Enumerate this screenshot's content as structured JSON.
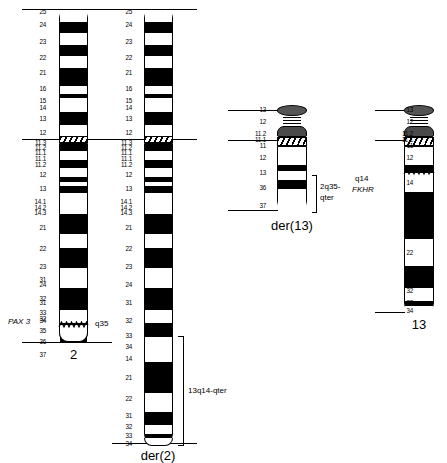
{
  "figure": {
    "type": "chromosome-ideogram"
  },
  "chromosomes": [
    {
      "id": "chr2",
      "name": "2",
      "type": "submetacentric",
      "p_labels": [
        "25",
        "24",
        "23",
        "22",
        "21",
        "16",
        "15",
        "14",
        "13",
        "12",
        "11.3",
        "11.2",
        "11.1"
      ],
      "q_labels": [
        "11.1",
        "11.2",
        "12",
        "13",
        "14.1",
        "14.2",
        "14.3",
        "21",
        "22",
        "23",
        "24",
        "31",
        "32",
        "33",
        "34",
        "35",
        "36",
        "37"
      ],
      "gene_label": "PAX 3",
      "breakpoint_label": "q35",
      "breakpoint_band": "35"
    },
    {
      "id": "der2",
      "name": "der(2)",
      "type": "submetacentric",
      "p_labels": [
        "25",
        "24",
        "23",
        "22",
        "21",
        "16",
        "15",
        "14",
        "13",
        "12",
        "11.3",
        "11.2",
        "11.1"
      ],
      "q_labels": [
        "11.1",
        "11.2",
        "12",
        "13",
        "14.1",
        "14.2",
        "14.3",
        "21",
        "22",
        "23",
        "24",
        "31",
        "32",
        "33",
        "34"
      ],
      "translocated_labels": [
        "14",
        "21",
        "22",
        "31",
        "32",
        "33",
        "34"
      ],
      "bracket_label": "13q14-qter"
    },
    {
      "id": "der13",
      "name": "der(13)",
      "type": "acrocentric",
      "p_labels": [
        "13",
        "12",
        "11.2",
        "11.1"
      ],
      "q_labels": [
        "11",
        "12",
        "13"
      ],
      "translocated_labels": [
        "36",
        "37"
      ],
      "bracket_label_line1": "2q35-",
      "bracket_label_line2": "qter"
    },
    {
      "id": "chr13",
      "name": "13",
      "type": "acrocentric",
      "p_labels": [
        "13",
        "12",
        "11.2",
        "11.1"
      ],
      "q_labels": [
        "11",
        "12",
        "13",
        "14",
        "21",
        "22",
        "32",
        "33",
        "34"
      ],
      "gene_label": "FKHR",
      "breakpoint_label": "q14",
      "breakpoint_band": "14"
    }
  ],
  "colors": {
    "band_dark": "#000000",
    "band_light": "#ffffff",
    "satellite": "#545454",
    "outline": "#000000",
    "background": "#ffffff"
  }
}
